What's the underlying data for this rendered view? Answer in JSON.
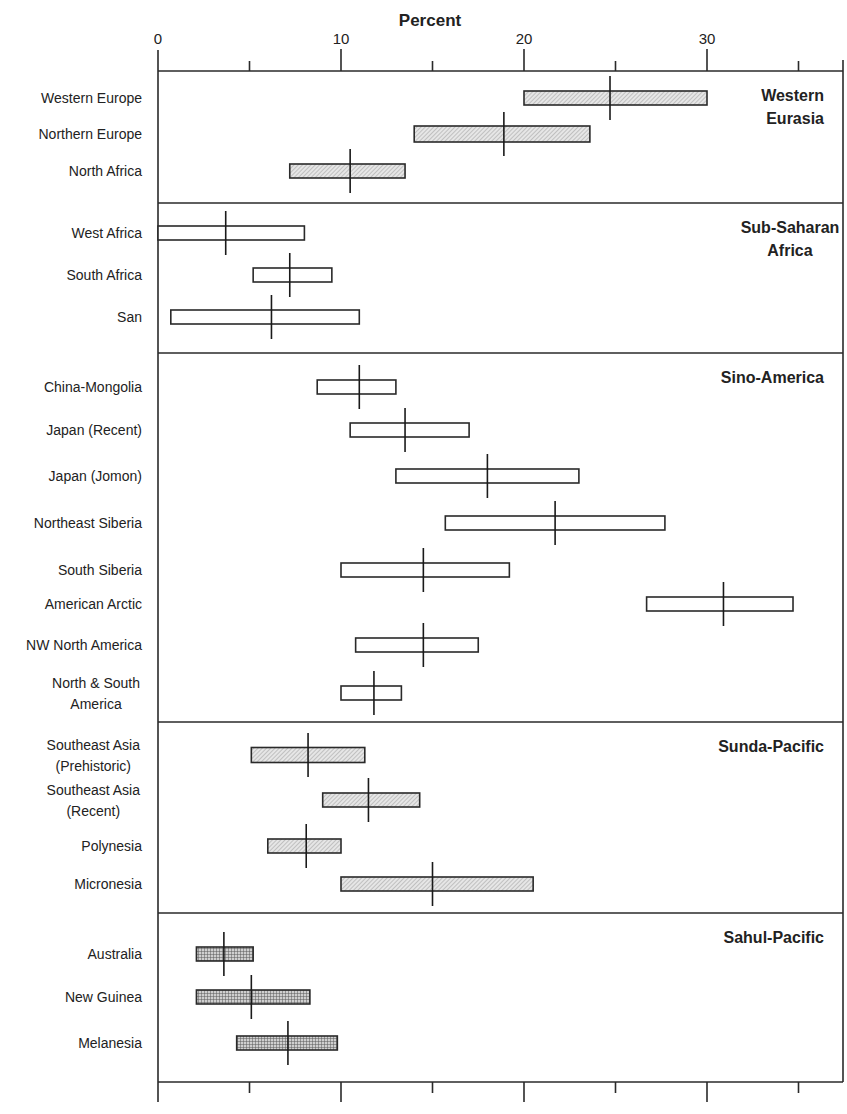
{
  "chart_data": {
    "type": "range-bar",
    "title": "",
    "xlabel": "Percent",
    "ylabel": "",
    "xlim": [
      0,
      37
    ],
    "x_ticks_major": [
      0,
      10,
      20,
      30
    ],
    "x_ticks_minor": [
      5,
      15,
      25,
      35
    ],
    "x_tick_labels": [
      "0",
      "10",
      "20",
      "30"
    ],
    "grid": false,
    "legend": null,
    "groups": [
      {
        "name": "Western Eurasia",
        "label_lines": [
          "Western",
          "Eurasia"
        ],
        "fill": "diagonal-hatch",
        "rows": [
          {
            "label": [
              "Western Europe"
            ],
            "low": 20.0,
            "high": 30.0,
            "median": 24.7
          },
          {
            "label": [
              "Northern Europe"
            ],
            "low": 14.0,
            "high": 23.6,
            "median": 18.9
          },
          {
            "label": [
              "North Africa"
            ],
            "low": 7.2,
            "high": 13.5,
            "median": 10.5
          }
        ]
      },
      {
        "name": "Sub-Saharan Africa",
        "label_lines": [
          "Sub-Saharan",
          "Africa"
        ],
        "fill": "none",
        "rows": [
          {
            "label": [
              "West Africa"
            ],
            "low": 0.0,
            "high": 8.0,
            "median": 3.7
          },
          {
            "label": [
              "South Africa"
            ],
            "low": 5.2,
            "high": 9.5,
            "median": 7.2
          },
          {
            "label": [
              "San"
            ],
            "low": 0.7,
            "high": 11.0,
            "median": 6.2
          }
        ]
      },
      {
        "name": "Sino-America",
        "label_lines": [
          "Sino-America"
        ],
        "fill": "none",
        "rows": [
          {
            "label": [
              "China-Mongolia"
            ],
            "low": 8.7,
            "high": 13.0,
            "median": 11.0
          },
          {
            "label": [
              "Japan (Recent)"
            ],
            "low": 10.5,
            "high": 17.0,
            "median": 13.5
          },
          {
            "label": [
              "Japan (Jomon)"
            ],
            "low": 13.0,
            "high": 23.0,
            "median": 18.0
          },
          {
            "label": [
              "Northeast Siberia"
            ],
            "low": 15.7,
            "high": 27.7,
            "median": 21.7
          },
          {
            "label": [
              "South Siberia"
            ],
            "low": 10.0,
            "high": 19.2,
            "median": 14.5
          },
          {
            "label": [
              "American Arctic"
            ],
            "low": 26.7,
            "high": 34.7,
            "median": 30.9
          },
          {
            "label": [
              "NW North America"
            ],
            "low": 10.8,
            "high": 17.5,
            "median": 14.5
          },
          {
            "label": [
              "North & South",
              "America"
            ],
            "low": 10.0,
            "high": 13.3,
            "median": 11.8
          }
        ]
      },
      {
        "name": "Sunda-Pacific",
        "label_lines": [
          "Sunda-Pacific"
        ],
        "fill": "diagonal-hatch",
        "rows": [
          {
            "label": [
              "Southeast Asia",
              "(Prehistoric)"
            ],
            "low": 5.1,
            "high": 11.3,
            "median": 8.2
          },
          {
            "label": [
              "Southeast Asia",
              "(Recent)"
            ],
            "low": 9.0,
            "high": 14.3,
            "median": 11.5
          },
          {
            "label": [
              "Polynesia"
            ],
            "low": 6.0,
            "high": 10.0,
            "median": 8.1
          },
          {
            "label": [
              "Micronesia"
            ],
            "low": 10.0,
            "high": 20.5,
            "median": 15.0
          }
        ]
      },
      {
        "name": "Sahul-Pacific",
        "label_lines": [
          "Sahul-Pacific"
        ],
        "fill": "crosshatch",
        "rows": [
          {
            "label": [
              "Australia"
            ],
            "low": 2.1,
            "high": 5.2,
            "median": 3.6
          },
          {
            "label": [
              "New Guinea"
            ],
            "low": 2.1,
            "high": 8.3,
            "median": 5.1
          },
          {
            "label": [
              "Melanesia"
            ],
            "low": 4.3,
            "high": 9.8,
            "median": 7.1
          }
        ]
      }
    ]
  },
  "colors": {
    "line": "#2a2a2a",
    "diagonal_hatch_bg": "#e6e6e6",
    "diagonal_hatch_line": "#9a9a9a",
    "crosshatch_bg": "#cfcfcf",
    "crosshatch_line": "#5a5a5a",
    "open_fill": "#ffffff"
  }
}
